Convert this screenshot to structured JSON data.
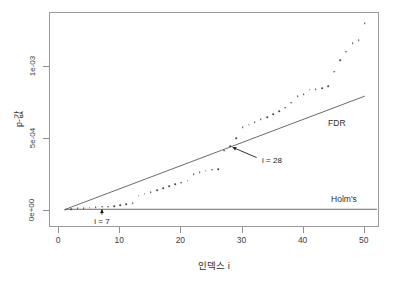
{
  "chart_data": {
    "type": "scatter",
    "title": "",
    "xlabel": "인덱스 i",
    "ylabel": "p-값",
    "xlim": [
      -1.5,
      52.5
    ],
    "ylim": [
      -0.00012,
      0.00138
    ],
    "xticks": [
      0,
      10,
      20,
      30,
      40,
      50
    ],
    "xticklabels": [
      "0",
      "10",
      "20",
      "30",
      "40",
      "50"
    ],
    "yticks": [
      0.0,
      0.0005,
      0.001
    ],
    "yticklabels": [
      "0e+00",
      "5e-04",
      "1e-03"
    ],
    "grid": false,
    "legend_position": "inline-right",
    "series": [
      {
        "name": "sorted p-values",
        "marker": "point",
        "color": "#4a4a4a",
        "x": [
          1,
          2,
          3,
          4,
          5,
          6,
          7,
          8,
          9,
          10,
          11,
          12,
          13,
          14,
          15,
          16,
          17,
          18,
          19,
          20,
          21,
          22,
          23,
          24,
          25,
          26,
          27,
          28,
          29,
          30,
          31,
          32,
          33,
          34,
          35,
          36,
          37,
          38,
          39,
          40,
          41,
          42,
          43,
          44,
          45,
          46,
          47,
          48,
          49,
          50
        ],
        "y": [
          6.5e-06,
          1.2e-05,
          1.65e-05,
          1.95e-05,
          2.25e-05,
          2.5e-05,
          2.75e-05,
          3e-05,
          3.2e-05,
          3.9e-05,
          4.6e-05,
          5.3e-05,
          0.000105,
          0.000118,
          0.000131,
          0.000145,
          0.000157,
          0.00017,
          0.000184,
          0.000196,
          0.00021,
          0.000256,
          0.00027,
          0.00028,
          0.000286,
          0.00029,
          0.00042,
          0.00045,
          0.000505,
          0.000585,
          0.0006,
          0.00062,
          0.00064,
          0.000655,
          0.000675,
          0.000695,
          0.00072,
          0.000755,
          0.0008,
          0.000815,
          0.000845,
          0.00085,
          0.000855,
          0.00087,
          0.00097,
          0.00105,
          0.00111,
          0.00117,
          0.00119,
          0.00131
        ]
      }
    ],
    "threshold_lines": [
      {
        "name": "FDR",
        "label": "FDR",
        "type": "line",
        "color": "#5a5a5a",
        "x_start": 1,
        "y_start": 1e-05,
        "x_end": 50,
        "y_end": 0.0008,
        "label_x": 44,
        "label_y": 0.00061
      },
      {
        "name": "Holm's",
        "label": "Holm's",
        "type": "line",
        "color": "#5a5a5a",
        "x_start": 1,
        "y_start": 1.05e-05,
        "x_end": 52,
        "y_end": 1.05e-05,
        "label_x": 44.5,
        "label_y": 8e-05
      }
    ],
    "annotations": [
      {
        "name": "i-28-annotation",
        "text": "i = 28",
        "point_x": 28,
        "point_y": 0.00045,
        "label_x": 33.2,
        "label_y": 0.000355
      },
      {
        "name": "i-7-annotation",
        "text": "i = 7",
        "point_x": 7,
        "point_y": 2.75e-05,
        "label_x": 7.0,
        "label_y": -6.8e-05
      }
    ]
  }
}
